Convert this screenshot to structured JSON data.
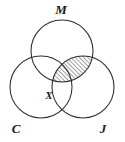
{
  "figure": {
    "background_color": "#ffffff",
    "stroke_color": "#2b2b2b",
    "hatch_color": "#1d1d1d",
    "width": 125,
    "height": 142
  },
  "sets": [
    {
      "id": "M",
      "label": "M",
      "label_x": 61,
      "label_y": 14,
      "center_x": 62,
      "center_y": 51,
      "radius": 31
    },
    {
      "id": "C",
      "label": "C",
      "label_x": 16,
      "label_y": 133,
      "center_x": 41,
      "center_y": 87,
      "radius": 31
    },
    {
      "id": "J",
      "label": "J",
      "label_x": 103,
      "label_y": 133,
      "center_x": 83,
      "center_y": 87,
      "radius": 31
    }
  ],
  "points": [
    {
      "id": "X",
      "label": "X",
      "x": 49,
      "y": 99
    }
  ],
  "shaded_region": {
    "description": "Intersection of M and J, excluding C",
    "pattern": "diagonal-hatch",
    "hatch_angle_deg": 45,
    "hatch_spacing": 3
  }
}
